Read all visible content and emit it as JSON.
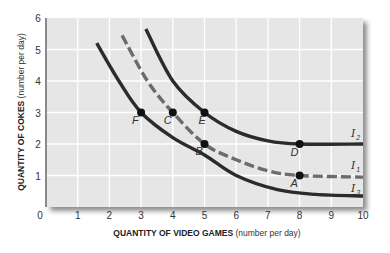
{
  "chart_data": {
    "type": "line",
    "title": "",
    "xlabel": {
      "bold": "QUANTITY OF VIDEO GAMES",
      "normal": " (number per day)"
    },
    "ylabel": {
      "bold": "QUANTITY OF COKES",
      "normal": " (number per day)"
    },
    "xlim": [
      0,
      10
    ],
    "ylim": [
      0,
      6
    ],
    "x_ticks": [
      "0",
      "1",
      "2",
      "3",
      "4",
      "5",
      "6",
      "7",
      "8",
      "9",
      "10"
    ],
    "y_ticks": [
      "1",
      "2",
      "3",
      "4",
      "5",
      "6"
    ],
    "grid": true,
    "series": [
      {
        "name": "I2",
        "label_main": "I",
        "label_sub": "2",
        "style": "solid",
        "points": [
          [
            3.15,
            5.65
          ],
          [
            4,
            4.0
          ],
          [
            5,
            3.0
          ],
          [
            6,
            2.4
          ],
          [
            7,
            2.1
          ],
          [
            8,
            2.0
          ],
          [
            10,
            2.0
          ]
        ]
      },
      {
        "name": "I1",
        "label_main": "I",
        "label_sub": "1",
        "style": "dashed",
        "points": [
          [
            2.4,
            5.45
          ],
          [
            3.2,
            4.0
          ],
          [
            4,
            3.0
          ],
          [
            5,
            2.0
          ],
          [
            6,
            1.5
          ],
          [
            7,
            1.15
          ],
          [
            8,
            1.0
          ],
          [
            10,
            0.95
          ]
        ]
      },
      {
        "name": "I3",
        "label_main": "I",
        "label_sub": "3",
        "style": "solid",
        "points": [
          [
            1.6,
            5.2
          ],
          [
            2.3,
            4.0
          ],
          [
            3,
            3.0
          ],
          [
            4,
            2.2
          ],
          [
            5,
            1.65
          ],
          [
            6,
            1.0
          ],
          [
            7.3,
            0.55
          ],
          [
            8.5,
            0.4
          ],
          [
            10,
            0.35
          ]
        ]
      }
    ],
    "labeled_points": [
      {
        "label": "F",
        "x": 3,
        "y": 3
      },
      {
        "label": "C",
        "x": 4,
        "y": 3
      },
      {
        "label": "E",
        "x": 5,
        "y": 3
      },
      {
        "label": "B",
        "x": 5,
        "y": 2
      },
      {
        "label": "D",
        "x": 8,
        "y": 2
      },
      {
        "label": "A",
        "x": 8,
        "y": 1
      }
    ],
    "colors": {
      "panel": "#e6e6e6",
      "grid": "#ffffff",
      "curve": "#2b2b2b",
      "dashed": "#6b6b6b",
      "axis": "#8a8a8a"
    }
  }
}
